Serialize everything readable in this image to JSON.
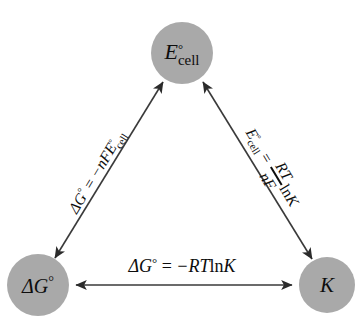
{
  "diagram": {
    "type": "triangle-relationship",
    "background_color": "#ffffff",
    "node_fill_color": "#a9a9a9",
    "edge_color": "#3a3a3a",
    "text_color": "#0d0d0d",
    "nodes": [
      {
        "id": "e-cell",
        "position": "top",
        "symbol": "E",
        "superscript": "°",
        "subscript": "cell",
        "plain_text": "E°cell",
        "cx": 182,
        "cy": 53,
        "r": 31
      },
      {
        "id": "delta-g",
        "position": "bottom-left",
        "symbol": "ΔG",
        "superscript": "°",
        "subscript": "",
        "plain_text": "ΔG°",
        "cx": 38,
        "cy": 285,
        "r": 31
      },
      {
        "id": "k",
        "position": "bottom-right",
        "symbol": "K",
        "superscript": "",
        "subscript": "",
        "plain_text": "K",
        "cx": 327,
        "cy": 285,
        "r": 28
      }
    ],
    "edges": [
      {
        "id": "edge-bottom",
        "from": "delta-g",
        "to": "k",
        "arrow": "double",
        "equation_plain": "ΔG° = −RT ln K",
        "parts": {
          "lhs_symbol": "ΔG",
          "lhs_superscript": "°",
          "equals": " = ",
          "rhs": "−RT",
          "log": "ln",
          "log_arg": "K"
        }
      },
      {
        "id": "edge-left",
        "from": "delta-g",
        "to": "e-cell",
        "arrow": "double",
        "equation_plain": "ΔG° = −nFE°cell",
        "parts": {
          "lhs_symbol": "ΔG",
          "lhs_superscript": "°",
          "equals": " = ",
          "coefficient": "−nF",
          "rhs_symbol": "E",
          "rhs_superscript": "°",
          "rhs_subscript": "cell"
        }
      },
      {
        "id": "edge-right",
        "from": "e-cell",
        "to": "k",
        "arrow": "double",
        "equation_plain": "E°cell = (RT / nF) ln K",
        "parts": {
          "lhs_symbol": "E",
          "lhs_superscript": "°",
          "lhs_subscript": "cell",
          "equals": " = ",
          "numerator": "RT",
          "denominator": "nF",
          "log": "ln",
          "log_arg": "K"
        }
      }
    ]
  }
}
